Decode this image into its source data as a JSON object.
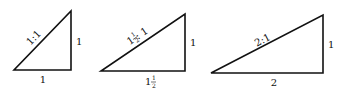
{
  "figure": {
    "triangles": [
      {
        "ratio_label": "1:1",
        "base_label": "1",
        "height_label": "1",
        "points": {
          "bl": [
            14,
            70
          ],
          "br": [
            71,
            70
          ],
          "top": [
            71,
            11
          ]
        }
      },
      {
        "ratio_label_whole": "1",
        "ratio_label_frac_num": "1",
        "ratio_label_frac_den": "2",
        "ratio_label_rest": " : 1",
        "base_label_whole": "1",
        "base_label_frac_num": "1",
        "base_label_frac_den": "2",
        "height_label": "1",
        "points": {
          "bl": [
            101,
            71
          ],
          "br": [
            185,
            71
          ],
          "top": [
            185,
            14
          ]
        }
      },
      {
        "ratio_label": "2:1",
        "base_label": "2",
        "height_label": "1",
        "points": {
          "bl": [
            211,
            73
          ],
          "br": [
            323,
            73
          ],
          "top": [
            323,
            15
          ]
        }
      }
    ],
    "stroke_color": "#111111"
  }
}
